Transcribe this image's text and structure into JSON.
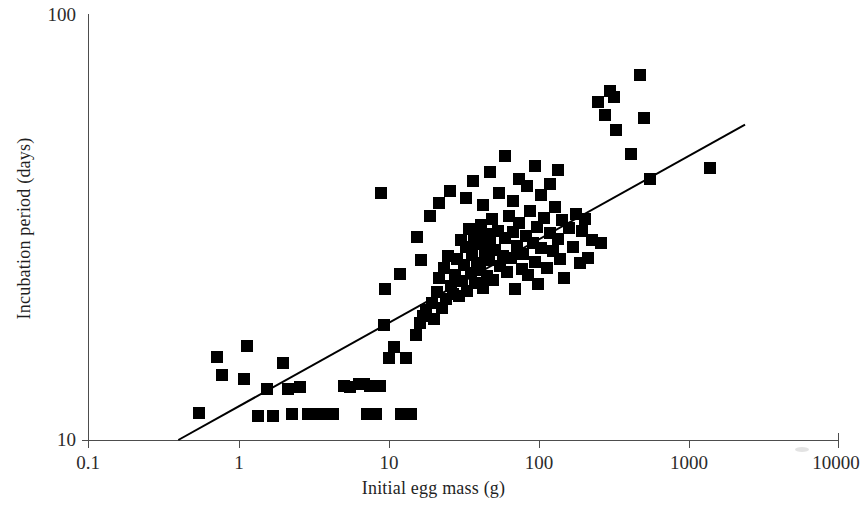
{
  "chart_data": {
    "type": "scatter",
    "title": "",
    "xlabel": "Initial egg mass (g)",
    "ylabel": "Incubation period (days)",
    "xscale": "log",
    "yscale": "log",
    "xlim": [
      0.1,
      10000
    ],
    "ylim": [
      10,
      100
    ],
    "grid": false,
    "legend": null,
    "marker": "filled-square",
    "marker_color": "#000000",
    "xticks": [
      0.1,
      1,
      10,
      100,
      1000,
      10000
    ],
    "xtick_labels": [
      "0.1",
      "1",
      "10",
      "100",
      "1000",
      "10000"
    ],
    "yticks": [
      10,
      100
    ],
    "ytick_labels": [
      "10",
      "100"
    ],
    "trendline": {
      "type": "power-law-fit",
      "x_start": 0.4,
      "y_start": 10.0,
      "x_end": 2400,
      "y_end": 55.0,
      "color": "#000000",
      "width_px": 2
    },
    "points": [
      [
        0.55,
        11.6
      ],
      [
        0.72,
        15.7
      ],
      [
        0.78,
        14.2
      ],
      [
        1.1,
        13.9
      ],
      [
        1.15,
        16.6
      ],
      [
        1.35,
        11.4
      ],
      [
        1.55,
        13.2
      ],
      [
        1.7,
        11.4
      ],
      [
        2.0,
        15.2
      ],
      [
        2.15,
        13.2
      ],
      [
        2.3,
        11.5
      ],
      [
        2.6,
        13.3
      ],
      [
        2.95,
        11.5
      ],
      [
        3.2,
        11.5
      ],
      [
        3.55,
        11.5
      ],
      [
        4.3,
        11.5
      ],
      [
        5.1,
        13.4
      ],
      [
        5.6,
        13.3
      ],
      [
        6.4,
        13.5
      ],
      [
        6.9,
        13.5
      ],
      [
        7.2,
        11.5
      ],
      [
        7.6,
        13.4
      ],
      [
        8.3,
        11.5
      ],
      [
        8.8,
        13.4
      ],
      [
        9.4,
        18.6
      ],
      [
        9.6,
        22.6
      ],
      [
        10.2,
        15.6
      ],
      [
        11.0,
        16.5
      ],
      [
        12.3,
        11.5
      ],
      [
        13.1,
        15.6
      ],
      [
        14.2,
        11.5
      ],
      [
        15.3,
        17.6
      ],
      [
        16.4,
        18.8
      ],
      [
        17.2,
        19.6
      ],
      [
        18.0,
        20.2
      ],
      [
        19.5,
        21.0
      ],
      [
        20.4,
        19.2
      ],
      [
        21.3,
        22.2
      ],
      [
        22.0,
        24.0
      ],
      [
        22.8,
        20.4
      ],
      [
        23.6,
        25.4
      ],
      [
        24.5,
        21.4
      ],
      [
        25.3,
        27.0
      ],
      [
        26.1,
        23.0
      ],
      [
        27.0,
        22.0
      ],
      [
        28.0,
        24.4
      ],
      [
        29.0,
        26.6
      ],
      [
        29.8,
        21.8
      ],
      [
        30.5,
        29.4
      ],
      [
        31.3,
        23.6
      ],
      [
        32.2,
        25.8
      ],
      [
        33.0,
        28.4
      ],
      [
        33.8,
        22.4
      ],
      [
        34.6,
        31.2
      ],
      [
        35.5,
        24.6
      ],
      [
        36.3,
        27.2
      ],
      [
        37.2,
        30.0
      ],
      [
        38.0,
        23.4
      ],
      [
        39.0,
        26.0
      ],
      [
        40.0,
        28.8
      ],
      [
        41.0,
        25.0
      ],
      [
        42.0,
        32.0
      ],
      [
        43.0,
        22.8
      ],
      [
        44.0,
        27.6
      ],
      [
        45.0,
        30.4
      ],
      [
        46.0,
        24.2
      ],
      [
        47.0,
        26.4
      ],
      [
        48.0,
        29.2
      ],
      [
        49.0,
        33.0
      ],
      [
        50.0,
        23.8
      ],
      [
        52.0,
        28.0
      ],
      [
        54.0,
        31.0
      ],
      [
        56.0,
        25.6
      ],
      [
        58.0,
        27.0
      ],
      [
        60.0,
        29.8
      ],
      [
        62.0,
        24.8
      ],
      [
        64.0,
        33.6
      ],
      [
        66.0,
        26.8
      ],
      [
        68.0,
        30.8
      ],
      [
        70.0,
        22.6
      ],
      [
        72.0,
        28.6
      ],
      [
        75.0,
        32.4
      ],
      [
        78.0,
        25.2
      ],
      [
        80.0,
        27.4
      ],
      [
        83.0,
        30.2
      ],
      [
        86.0,
        24.4
      ],
      [
        89.0,
        34.4
      ],
      [
        92.0,
        29.0
      ],
      [
        95.0,
        26.2
      ],
      [
        98.0,
        31.6
      ],
      [
        100.0,
        23.2
      ],
      [
        105.0,
        28.2
      ],
      [
        110.0,
        33.2
      ],
      [
        115.0,
        25.4
      ],
      [
        120.0,
        30.6
      ],
      [
        125.0,
        27.8
      ],
      [
        130.0,
        35.2
      ],
      [
        135.0,
        29.6
      ],
      [
        140.0,
        26.6
      ],
      [
        145.0,
        32.8
      ],
      [
        150.0,
        24.0
      ],
      [
        160.0,
        31.4
      ],
      [
        170.0,
        28.4
      ],
      [
        180.0,
        34.0
      ],
      [
        190.0,
        26.0
      ],
      [
        22.0,
        36.0
      ],
      [
        26.0,
        38.5
      ],
      [
        33.0,
        37.0
      ],
      [
        37.0,
        40.5
      ],
      [
        43.0,
        35.6
      ],
      [
        48.0,
        42.5
      ],
      [
        55.0,
        38.0
      ],
      [
        60.0,
        46.5
      ],
      [
        68.0,
        36.4
      ],
      [
        75.0,
        41.0
      ],
      [
        85.0,
        39.5
      ],
      [
        95.0,
        44.0
      ],
      [
        105.0,
        37.5
      ],
      [
        120.0,
        40.0
      ],
      [
        135.0,
        43.0
      ],
      [
        9.0,
        38.0
      ],
      [
        15.5,
        30.0
      ],
      [
        16.5,
        26.5
      ],
      [
        19.0,
        33.5
      ],
      [
        12.0,
        24.5
      ],
      [
        205.0,
        33.0
      ],
      [
        230.0,
        29.5
      ],
      [
        250.0,
        62.0
      ],
      [
        280.0,
        58.0
      ],
      [
        300.0,
        66.0
      ],
      [
        320.0,
        64.0
      ],
      [
        330.0,
        53.5
      ],
      [
        420.0,
        47.0
      ],
      [
        480.0,
        72.0
      ],
      [
        510.0,
        57.0
      ],
      [
        560.0,
        41.0
      ],
      [
        1400.0,
        43.5
      ],
      [
        195.0,
        31.0
      ],
      [
        215.0,
        26.8
      ],
      [
        265.0,
        29.0
      ]
    ],
    "n_points": 140
  },
  "figure": {
    "background_color": "#ffffff",
    "axis_color": "#4d4d4d",
    "text_color": "#1f1f1f"
  }
}
